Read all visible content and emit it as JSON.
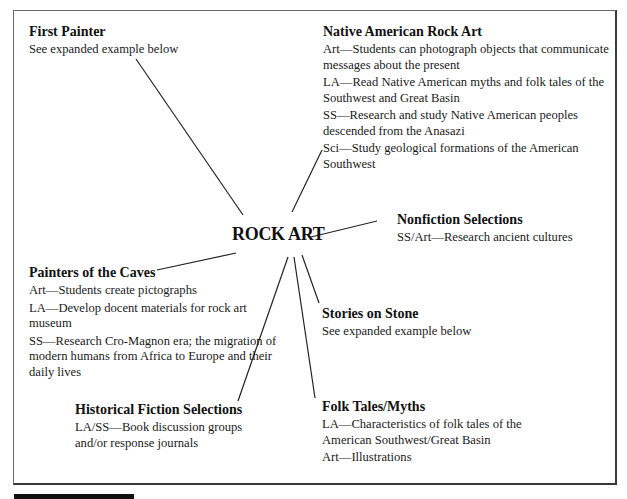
{
  "center": {
    "label": "ROCK ART"
  },
  "nodes": {
    "first_painter": {
      "title": "First Painter",
      "items": [
        "See expanded example below"
      ]
    },
    "native_american": {
      "title": "Native American Rock Art",
      "items": [
        "Art—Students can photograph objects that communicate messages about the present",
        "LA—Read Native American myths and folk tales of the Southwest and Great Basin",
        "SS—Research and study Native American peoples descended from the Anasazi",
        "Sci—Study geological formations of the American Southwest"
      ]
    },
    "nonfiction": {
      "title": "Nonfiction Selections",
      "items": [
        "SS/Art—Research ancient cultures"
      ]
    },
    "painters_caves": {
      "title": "Painters of the Caves",
      "items": [
        "Art—Students create pictographs",
        "LA—Develop docent materials for rock art museum",
        "SS—Research Cro-Magnon era; the migration of modern humans from Africa to Europe and their daily lives"
      ]
    },
    "stories_stone": {
      "title": "Stories on Stone",
      "items": [
        "See expanded example below"
      ]
    },
    "historical_fiction": {
      "title": "Historical Fiction Selections",
      "items": [
        "LA/SS—Book discussion groups and/or response journals"
      ]
    },
    "folk_tales": {
      "title": "Folk Tales/Myths",
      "items": [
        "LA—Characteristics of folk tales of  the American Southwest/Great Basin",
        "Art—Illustrations"
      ]
    }
  }
}
